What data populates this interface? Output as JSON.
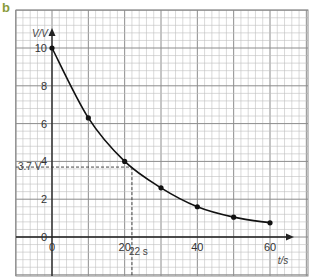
{
  "panel_label": "b",
  "colors": {
    "grid_minor": "#bfbfbf",
    "grid_major": "#8c8c8c",
    "axis": "#222222",
    "curve": "#111111",
    "panel_label": "#8a9b3a"
  },
  "chart_data": {
    "type": "line",
    "title": "",
    "xlabel": "t/s",
    "ylabel": "V/V",
    "xlim": [
      0,
      60
    ],
    "ylim": [
      0,
      10
    ],
    "x_ticks": [
      0,
      20,
      40,
      60
    ],
    "y_ticks": [
      0,
      2,
      4,
      6,
      8,
      10
    ],
    "grid": true,
    "legend": null,
    "series": [
      {
        "name": "Capacitor discharge",
        "x": [
          0,
          10,
          20,
          30,
          40,
          50,
          60
        ],
        "y": [
          10,
          6.3,
          4.0,
          2.6,
          1.6,
          1.05,
          0.75
        ],
        "markers": true,
        "smooth": true
      }
    ],
    "annotations": [
      {
        "type": "dashed-guide",
        "x": 22,
        "y": 3.7,
        "x_label": "22 s",
        "y_label": "3.7 V"
      }
    ]
  }
}
